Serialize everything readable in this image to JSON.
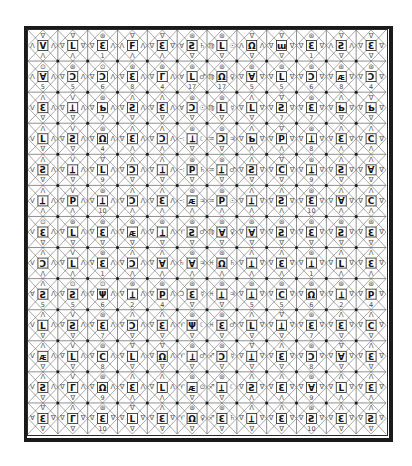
{
  "document": {
    "title": "",
    "grid": {
      "rows": 13,
      "cols": 12
    },
    "colors": {
      "ink": "#1a1a1a",
      "paper": "#ffffff",
      "faint": "#555555"
    }
  },
  "legend_note": "Each cell: top glyph, left glyph, central boxed letter, right glyph, bottom glyph or number",
  "cells": [
    [
      [
        "∇",
        "Λ",
        "V",
        "Λ",
        "Λ"
      ],
      [
        "∇",
        "∇",
        "L",
        "∇",
        "Λ"
      ],
      [
        "⊛",
        "∇",
        "Ɛ",
        "Λ",
        "1"
      ],
      [
        "∇",
        "Λ",
        "F",
        "Λ",
        "Λ"
      ],
      [
        "∇",
        "∇",
        "Ɛ",
        "∇",
        "Λ"
      ],
      [
        "⊛",
        "Ɐ",
        "Ƨ",
        "♄",
        "∇"
      ],
      [
        "⊛",
        "♍",
        "L",
        "☉",
        "∇"
      ],
      [
        "∇",
        "Λ",
        "Ω",
        "Λ",
        "∇"
      ],
      [
        "∇",
        "∇",
        "ɯ",
        "∇",
        "∇"
      ],
      [
        "⊛",
        "∇",
        "Ɛ",
        "∇",
        "1"
      ],
      [
        "∇",
        "Λ",
        "Ƨ",
        "Λ",
        "∇"
      ],
      [
        "∇",
        "∇",
        "Ɛ",
        "∇",
        "∇"
      ]
    ],
    [
      [
        "⊙",
        "Λ",
        "Ɐ",
        "Λ",
        "5"
      ],
      [
        "⊛",
        "∇",
        "Ↄ",
        "Λ",
        "5"
      ],
      [
        "⊙",
        "∇",
        "Ↄ",
        "Λ",
        "6"
      ],
      [
        "⊛",
        "∇",
        "Ɛ",
        "Λ",
        "8"
      ],
      [
        "⊛",
        "∇",
        "Γ",
        "Λ",
        "4"
      ],
      [
        "⊛",
        "Ɐ",
        "L",
        "♂",
        "17"
      ],
      [
        "⊛",
        "♍",
        "Ω",
        "♀",
        "17"
      ],
      [
        "⊛",
        "∇",
        "Ɐ",
        "∇",
        "5"
      ],
      [
        "⊛",
        "∇",
        "L",
        "∇",
        "5"
      ],
      [
        "⊛",
        "∇",
        "Ↄ",
        "∇",
        "6"
      ],
      [
        "⊛",
        "∇",
        "ᴁ",
        "∇",
        "8"
      ],
      [
        "⊛",
        "∇",
        "Ↄ",
        "∇",
        "4"
      ]
    ],
    [
      [
        "Λ",
        "V",
        "Ɛ",
        "Λ",
        "∇"
      ],
      [
        "V",
        "∇",
        "Ʇ",
        "Λ",
        "∇"
      ],
      [
        "⊛",
        "∇",
        "Ƅ",
        "Λ",
        "7"
      ],
      [
        "Λ",
        "∇",
        "Ƨ",
        "Λ",
        "∇"
      ],
      [
        "Λ",
        "∇",
        "Ɛ",
        "Λ",
        "∇"
      ],
      [
        "⊛",
        "Ɐ",
        "Ↄ",
        "☉",
        "∇"
      ],
      [
        "⊛",
        "♍",
        "L",
        "☿",
        "∇"
      ],
      [
        "Λ",
        "∇",
        "L",
        "∇",
        "∇"
      ],
      [
        "∇",
        "∇",
        "Ƨ",
        "∇",
        "7"
      ],
      [
        "⊛",
        "∇",
        "Ɛ",
        "∇",
        "7"
      ],
      [
        "Λ",
        "∇",
        "Ƅ",
        "∇",
        "∇"
      ],
      [
        "∇",
        "∇",
        "Ƅ",
        "∇",
        "∇"
      ]
    ],
    [
      [
        "Λ",
        "V",
        "L",
        "Λ",
        "∇"
      ],
      [
        "V",
        "∇",
        "Ƨ",
        "Λ",
        "∇"
      ],
      [
        "⊛",
        "∇",
        "Ω",
        "Λ",
        "4"
      ],
      [
        "Λ",
        "∇",
        "Ɛ",
        "Λ",
        "Λ"
      ],
      [
        "Λ",
        "∇",
        "Ↄ",
        "Λ",
        "Λ"
      ],
      [
        "⊛",
        "∹",
        "Ʇ",
        "☾",
        "∇"
      ],
      [
        "⊛",
        "♒",
        "Ↄ",
        "♃",
        "∇"
      ],
      [
        "Λ",
        "∇",
        "Ƅ",
        "∇",
        "Λ"
      ],
      [
        "∇",
        "∇",
        "P",
        "∇",
        "Λ"
      ],
      [
        "⊛",
        "∇",
        "Ʇ",
        "∇",
        "8"
      ],
      [
        "Λ",
        "∇",
        "Ɛ",
        "∇",
        "Λ"
      ],
      [
        "Λ",
        "∇",
        "C",
        "∇",
        "Λ"
      ]
    ],
    [
      [
        "Λ",
        "V",
        "Ƨ",
        "Λ",
        "∇"
      ],
      [
        "V",
        "∇",
        "Ʇ",
        "Λ",
        "∇"
      ],
      [
        "∇",
        "∇",
        "L",
        "Λ",
        "9"
      ],
      [
        "Λ",
        "∇",
        "Ↄ",
        "Λ",
        "∇"
      ],
      [
        "Λ",
        "∇",
        "Ʇ",
        "Λ",
        "∇"
      ],
      [
        "⊛",
        "∹",
        "P",
        "♄",
        "∇"
      ],
      [
        "⊛",
        "♒",
        "Ʇ",
        "♂",
        "∇"
      ],
      [
        "Λ",
        "∇",
        "Ƨ",
        "∇",
        "∇"
      ],
      [
        "∇",
        "∇",
        "C",
        "∇",
        "∇"
      ],
      [
        "⊛",
        "∇",
        "Ʇ",
        "∇",
        "9"
      ],
      [
        "Λ",
        "∇",
        "Ƨ",
        "∇",
        "∇"
      ],
      [
        "Λ",
        "∇",
        "Ɐ",
        "∇",
        "∇"
      ]
    ],
    [
      [
        "Λ",
        "V",
        "Ʇ",
        "Λ",
        "Λ"
      ],
      [
        "V",
        "∇",
        "P",
        "Λ",
        "Λ"
      ],
      [
        "⊛",
        "∇",
        "Ʇ",
        "Λ",
        "10"
      ],
      [
        "Λ",
        "∇",
        "Ↄ",
        "Λ",
        "Λ"
      ],
      [
        "Λ",
        "∇",
        "Ɛ",
        "Λ",
        "Λ"
      ],
      [
        "⊛",
        "∹",
        "ᴁ",
        "♃",
        "Λ"
      ],
      [
        "⊛",
        "♒",
        "P",
        "☉",
        "Λ"
      ],
      [
        "Λ",
        "∇",
        "Ʇ",
        "∇",
        "Λ"
      ],
      [
        "Λ",
        "∇",
        "Ƨ",
        "∇",
        "Λ"
      ],
      [
        "⊛",
        "∇",
        "Ɛ",
        "∇",
        "10"
      ],
      [
        "Λ",
        "∇",
        "Ɐ",
        "∇",
        "Λ"
      ],
      [
        "Λ",
        "∇",
        "C",
        "∇",
        "Λ"
      ]
    ],
    [
      [
        "⊙",
        "V",
        "Ɛ",
        "Λ",
        "∇"
      ],
      [
        "⊛",
        "∇",
        "L",
        "Λ",
        "∇"
      ],
      [
        "⊛",
        "∇",
        "Ɛ",
        "Λ",
        "∇"
      ],
      [
        "⊛",
        "∇",
        "ᴁ",
        "Λ",
        "∇"
      ],
      [
        "⊛",
        "∇",
        "Ʇ",
        "Λ",
        "∇"
      ],
      [
        "⊛",
        "♈",
        "Ƨ",
        "♂",
        "∇"
      ],
      [
        "⊛",
        "♍",
        "Ɐ",
        "♀",
        "∇"
      ],
      [
        "⊛",
        "∇",
        "Ɐ",
        "∇",
        "∇"
      ],
      [
        "⊛",
        "∇",
        "Ƨ",
        "∇",
        "∇"
      ],
      [
        "⊛",
        "∇",
        "Ɛ",
        "∇",
        "∇"
      ],
      [
        "⊛",
        "∇",
        "Ƨ",
        "∇",
        "∇"
      ],
      [
        "⊛",
        "∇",
        "Ɛ",
        "∇",
        "∇"
      ]
    ],
    [
      [
        "Λ",
        "V",
        "Ↄ",
        "Λ",
        "Λ"
      ],
      [
        "V",
        "∇",
        "L",
        "Λ",
        "Λ"
      ],
      [
        "⊛",
        "∇",
        "Ɛ",
        "Λ",
        "1"
      ],
      [
        "Λ",
        "∇",
        "Ↄ",
        "Λ",
        "Λ"
      ],
      [
        "Λ",
        "∇",
        "Ɐ",
        "Λ",
        "Λ"
      ],
      [
        "⊛",
        "♄",
        "Ɐ",
        "♃",
        "Λ"
      ],
      [
        "⊛",
        "♓",
        "Ω",
        "♄",
        "Λ"
      ],
      [
        "Λ",
        "∇",
        "Ʇ",
        "∇",
        "Λ"
      ],
      [
        "Λ",
        "∇",
        "Ɛ",
        "∇",
        "Λ"
      ],
      [
        "⊛",
        "∇",
        "Ʇ",
        "∇",
        "1"
      ],
      [
        "Λ",
        "∇",
        "L",
        "∇",
        "Λ"
      ],
      [
        "Λ",
        "∇",
        "Ɛ",
        "∇",
        "Λ"
      ]
    ],
    [
      [
        "Λ",
        "Ɐ",
        "Ƨ",
        "Λ",
        "5"
      ],
      [
        "⊙",
        "∇",
        "Ƨ",
        "Λ",
        "5"
      ],
      [
        "⊙",
        "∇",
        "Ψ",
        "Λ",
        "6"
      ],
      [
        "⊛",
        "∇",
        "Ʇ",
        "Λ",
        "2"
      ],
      [
        "⊛",
        "∇",
        "P",
        "Λ",
        "4"
      ],
      [
        "⊛",
        "Ↄ",
        "Ɛ",
        "☿",
        "∇"
      ],
      [
        "⊛",
        "♓",
        "Ʇ",
        "♃",
        "∇"
      ],
      [
        "⊛",
        "∇",
        "Ʇ",
        "∇",
        "5"
      ],
      [
        "⊛",
        "∇",
        "C",
        "∇",
        "5"
      ],
      [
        "⊛",
        "∇",
        "Ω",
        "∇",
        "6"
      ],
      [
        "⊛",
        "∇",
        "Ʇ",
        "∇",
        "2"
      ],
      [
        "⊛",
        "∇",
        "P",
        "∇",
        "4"
      ]
    ],
    [
      [
        "Λ",
        "V",
        "L",
        "Λ",
        "∇"
      ],
      [
        "V",
        "∇",
        "Ƨ",
        "Λ",
        "∇"
      ],
      [
        "⊛",
        "∇",
        "Ɛ",
        "Λ",
        "7"
      ],
      [
        "Λ",
        "∇",
        "Ↄ",
        "Λ",
        "∇"
      ],
      [
        "Λ",
        "∇",
        "Ɛ",
        "Λ",
        "∇"
      ],
      [
        "⊛",
        "♈",
        "Ψ",
        "☾",
        "∇"
      ],
      [
        "⊛",
        "♓",
        "Ɛ",
        "♂",
        "∇"
      ],
      [
        "Λ",
        "∇",
        "L",
        "∇",
        "∇"
      ],
      [
        "∇",
        "∇",
        "Ʇ",
        "∇",
        "∇"
      ],
      [
        "⊛",
        "∇",
        "Ɛ",
        "∇",
        "7"
      ],
      [
        "Λ",
        "∇",
        "Ɛ",
        "∇",
        "∇"
      ],
      [
        "Λ",
        "∇",
        "C",
        "∇",
        "∇"
      ]
    ],
    [
      [
        "Λ",
        "V",
        "ᴁ",
        "Λ",
        "∇"
      ],
      [
        "V",
        "∇",
        "L",
        "Λ",
        "∇"
      ],
      [
        "⊛",
        "∇",
        "C",
        "Λ",
        "8"
      ],
      [
        "∇",
        "∇",
        "L",
        "Λ",
        "∇"
      ],
      [
        "∇",
        "∇",
        "Ω",
        "Λ",
        "∇"
      ],
      [
        "⊛",
        "♈",
        "Ʇ",
        "♂",
        "∇"
      ],
      [
        "⊛",
        "♐",
        "Ↄ",
        "☿",
        "∇"
      ],
      [
        "∇",
        "∇",
        "Ʇ",
        "∇",
        "∇"
      ],
      [
        "Λ",
        "∇",
        "Ɛ",
        "∇",
        "∇"
      ],
      [
        "⊛",
        "∇",
        "Ↄ",
        "∇",
        "8"
      ],
      [
        "∇",
        "∇",
        "Ɐ",
        "∇",
        "∇"
      ],
      [
        "Λ",
        "∇",
        "Ɛ",
        "∇",
        "∇"
      ]
    ],
    [
      [
        "Λ",
        "V",
        "Ƨ",
        "Λ",
        "∇"
      ],
      [
        "V",
        "∇",
        "Γ",
        "Λ",
        "∇"
      ],
      [
        "⊛",
        "∇",
        "Ω",
        "Λ",
        "9"
      ],
      [
        "Λ",
        "∇",
        "Ɛ",
        "Λ",
        "Λ"
      ],
      [
        "Λ",
        "∇",
        "L",
        "Λ",
        "Λ"
      ],
      [
        "⊛",
        "♈",
        "ᴁ",
        "⊙",
        "∇"
      ],
      [
        "⊛",
        "♐",
        "Ʇ",
        "☾",
        "∇"
      ],
      [
        "Λ",
        "∇",
        "Ƨ",
        "∇",
        "Λ"
      ],
      [
        "Λ",
        "∇",
        "Ɛ",
        "∇",
        "Λ"
      ],
      [
        "⊛",
        "∇",
        "Ɐ",
        "∇",
        "9"
      ],
      [
        "Λ",
        "∇",
        "L",
        "∇",
        "Λ"
      ],
      [
        "Λ",
        "∇",
        "Ɛ",
        "∇",
        "Λ"
      ]
    ],
    [
      [
        "∇",
        "Ɐ",
        "Ɛ",
        "∇",
        "∇"
      ],
      [
        "Λ",
        "∇",
        "Γ",
        "∇",
        "∇"
      ],
      [
        "⊛",
        "∇",
        "Ɛ",
        "∇",
        "10"
      ],
      [
        "∇",
        "∇",
        "L",
        "∇",
        "∇"
      ],
      [
        "Λ",
        "∇",
        "Ɛ",
        "∇",
        "∇"
      ],
      [
        "⊛",
        "♈",
        "Ω",
        "♀",
        "∇"
      ],
      [
        "⊛",
        "♐",
        "Ɛ",
        "♄",
        "∇"
      ],
      [
        "Λ",
        "∇",
        "Ʇ",
        "∇",
        "∇"
      ],
      [
        "Λ",
        "∇",
        "Ɛ",
        "∇",
        "∇"
      ],
      [
        "⊛",
        "∇",
        "Ƨ",
        "∇",
        "10"
      ],
      [
        "Λ",
        "∇",
        "Ɛ",
        "∇",
        "∇"
      ],
      [
        "Λ",
        "∇",
        "Ƨ",
        "∇",
        "∇"
      ]
    ]
  ]
}
